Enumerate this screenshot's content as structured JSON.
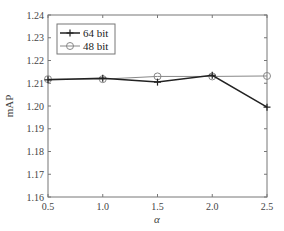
{
  "chart_data": {
    "type": "line",
    "title": "",
    "xlabel": "α",
    "ylabel": "mAP",
    "x": [
      0.5,
      1.0,
      1.5,
      2.0,
      2.5
    ],
    "xticks": [
      "0.5",
      "1.0",
      "1.5",
      "2.0",
      "2.5"
    ],
    "yticks": [
      "1.16",
      "1.17",
      "1.18",
      "1.19",
      "1.20",
      "1.21",
      "1.22",
      "1.23",
      "1.24"
    ],
    "xlim": [
      0.5,
      2.5
    ],
    "ylim": [
      1.16,
      1.24
    ],
    "grid": false,
    "legend_position": "upper left",
    "series": [
      {
        "name": "64 bit",
        "marker": "plus",
        "color": "#222222",
        "values": [
          1.2115,
          1.2122,
          1.2105,
          1.2135,
          1.1995
        ]
      },
      {
        "name": "48 bit",
        "marker": "circle",
        "color": "#888888",
        "values": [
          1.2118,
          1.2118,
          1.213,
          1.213,
          1.2132
        ]
      }
    ]
  }
}
